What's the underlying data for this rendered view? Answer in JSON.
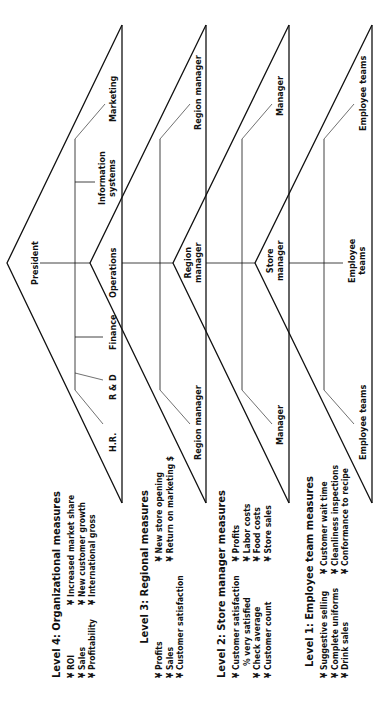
{
  "diagram": {
    "levels": [
      {
        "id": 4,
        "apex": "President",
        "units": [
          "H.R.",
          "R & D",
          "Finance",
          "Operations",
          "Information systems",
          "Marketing"
        ],
        "measures": {
          "title": "Level 4: Organizational measures",
          "col1": [
            "¥ ROI",
            "¥ Sales",
            "¥ Profitability"
          ],
          "col2": [
            "¥ Increased market share",
            "¥ New customer growth",
            "¥ International gross"
          ]
        }
      },
      {
        "id": 3,
        "apex": "Operations",
        "units": [
          "Region manager",
          "Region manager",
          "Region manager"
        ],
        "measures": {
          "title": "Level 3: Regional measures",
          "col1": [
            "¥ Profits",
            "¥ Sales",
            "¥ Customer satisfaction"
          ],
          "col2": [
            "¥ New store opening",
            "¥ Return on marketing $"
          ]
        }
      },
      {
        "id": 2,
        "apex": "Region manager",
        "units": [
          "Manager",
          "Store manager",
          "Manager"
        ],
        "measures": {
          "title": "Level 2: Store manager measures",
          "col1": [
            "¥ Customer satisfaction",
            "   % very satisfied",
            "¥ Check average",
            "¥ Customer count"
          ],
          "col2": [
            "¥ Profits",
            "¥ Labor costs",
            "¥ Food costs",
            "¥ Store sales"
          ]
        }
      },
      {
        "id": 1,
        "apex": "Store manager",
        "units": [
          "Employee teams",
          "Employee teams",
          "Employee teams"
        ],
        "measures": {
          "title": "Level 1: Employee team measures",
          "col1": [
            "¥ Suggestive selling",
            "¥ Complete uniforms",
            "¥ Drink sales"
          ],
          "col2": [
            "¥ Customer wait time",
            "¥ Cleanliness inspections",
            "¥ Conformance to recipe"
          ]
        }
      }
    ],
    "labels": {
      "president": "President",
      "hr": "H.R.",
      "rd": "R & D",
      "finance": "Finance",
      "operations": "Operations",
      "info1": "Information",
      "info2": "systems",
      "marketing": "Marketing",
      "region_manager_top": "Region manager",
      "region_manager_bottom": "Region manager",
      "region1": "Region",
      "region2": "manager",
      "manager_top": "Manager",
      "manager_bottom": "Manager",
      "store1": "Store",
      "store2": "manager",
      "teams_top": "Employee teams",
      "teams_bottom": "Employee teams",
      "teams_mid1": "Employee",
      "teams_mid2": "teams"
    }
  }
}
